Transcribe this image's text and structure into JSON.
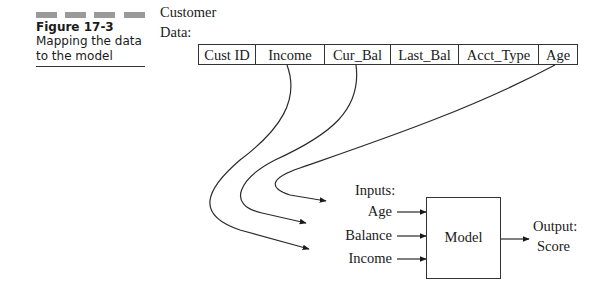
{
  "figure": {
    "number": "Figure 17-3",
    "caption_lines": [
      "Mapping the data",
      "to the model"
    ],
    "accent_bar_color": "#9a9a9a"
  },
  "customer_data": {
    "label_lines": [
      "Customer",
      "Data:"
    ],
    "columns": [
      "Cust ID",
      "Income",
      "Cur_Bal",
      "Last_Bal",
      "Acct_Type",
      "Age"
    ]
  },
  "model": {
    "inputs_label": "Inputs:",
    "inputs": [
      "Age",
      "Balance",
      "Income"
    ],
    "box_label": "Model",
    "output_label": "Output:",
    "output_value": "Score"
  },
  "mappings": [
    {
      "from": "Age",
      "to": "Age"
    },
    {
      "from": "Cur_Bal",
      "to": "Balance"
    },
    {
      "from": "Income",
      "to": "Income"
    }
  ]
}
